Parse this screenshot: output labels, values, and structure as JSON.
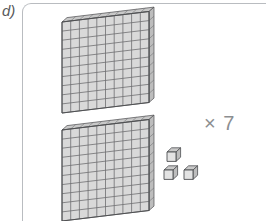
{
  "exercise": {
    "item_label": "d)",
    "multiplier_label": "× 7"
  },
  "palette": {
    "face_fill": "#d9d9d9",
    "face_fill_light": "#e3e3e3",
    "top_fill": "#c9c9c9",
    "side_fill": "#bdbdbd",
    "grid_stroke": "#6e6f71",
    "outline_stroke": "#4d4e50",
    "frame_stroke": "#b9bcc0",
    "label_color": "#58595b",
    "multiplier_color": "#8c8e91",
    "background": "#ffffff"
  },
  "manipulatives": {
    "description": "Base-ten blocks representation",
    "hundred_flats": [
      {
        "name": "hundred-flat-top",
        "rows": 10,
        "columns": 10,
        "value": 100,
        "origin_x": 62,
        "origin_y": 22
      },
      {
        "name": "hundred-flat-bottom",
        "rows": 10,
        "columns": 10,
        "value": 100,
        "origin_x": 62,
        "origin_y": 130
      }
    ],
    "unit_cubes": [
      {
        "name": "unit-cube-1",
        "value": 1,
        "origin_x": 167,
        "origin_y": 152
      },
      {
        "name": "unit-cube-2",
        "value": 1,
        "origin_x": 164,
        "origin_y": 170
      },
      {
        "name": "unit-cube-3",
        "value": 1,
        "origin_x": 184,
        "origin_y": 170
      }
    ],
    "total_shown": 203,
    "flat_geometry": {
      "cell_width": 8.7,
      "cell_height": 9.1,
      "skew_x": -1.05,
      "depth_x": 5.0,
      "depth_y": -4.4
    },
    "cube_geometry": {
      "cell_width": 9.0,
      "cell_height": 9.4,
      "depth_x": 4.6,
      "depth_y": -4.2
    }
  }
}
